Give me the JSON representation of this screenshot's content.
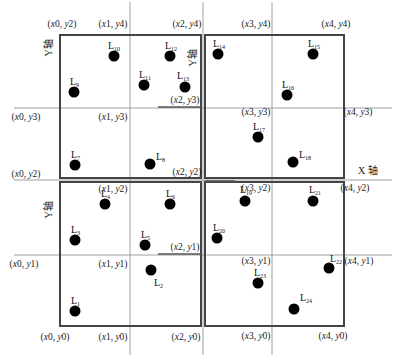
{
  "diagram": {
    "title": "",
    "axis_labels": {
      "x": "X 轴",
      "y_top": "Y轴",
      "y_mid": "Y轴",
      "y_bottom": "Y轴"
    },
    "colors": {
      "frame": "#444444",
      "grid": "#888888",
      "point": "#000000",
      "text": "#222222"
    },
    "quadrants": [
      {
        "name": "top-left",
        "x0": 60,
        "y0": 35,
        "x1": 201,
        "y1": 178
      },
      {
        "name": "top-right",
        "x0": 205,
        "y0": 35,
        "x1": 344,
        "y1": 178
      },
      {
        "name": "bottom-left",
        "x0": 60,
        "y0": 182,
        "x1": 201,
        "y1": 326
      },
      {
        "name": "bottom-right",
        "x0": 205,
        "y0": 182,
        "x1": 344,
        "y1": 326
      }
    ],
    "coordinate_labels": [
      {
        "id": "x0y2_top",
        "text": "(x0, y2)",
        "x": 62,
        "y": 27
      },
      {
        "id": "x1y4",
        "text": "(x1, y4)",
        "x": 113,
        "y": 27
      },
      {
        "id": "x2y4",
        "text": "(x2, y4)",
        "x": 187,
        "y": 27
      },
      {
        "id": "x3y4",
        "text": "(x3, y4)",
        "x": 256,
        "y": 27
      },
      {
        "id": "x4y4",
        "text": "(x4, y4)",
        "x": 336,
        "y": 27
      },
      {
        "id": "x0y3",
        "text": "(x0, y3)",
        "x": 26,
        "y": 120
      },
      {
        "id": "x1y3",
        "text": "(x1, y3)",
        "x": 113,
        "y": 120
      },
      {
        "id": "x2y3",
        "text": "(x2, y3)",
        "x": 185,
        "y": 103
      },
      {
        "id": "x3y3",
        "text": "(x3, y3)",
        "x": 256,
        "y": 115
      },
      {
        "id": "x4y3",
        "text": "(x4, y3)",
        "x": 358,
        "y": 115
      },
      {
        "id": "x0y2",
        "text": "(x0, y2)",
        "x": 26,
        "y": 177
      },
      {
        "id": "x2y2",
        "text": "(x2, y2)",
        "x": 187,
        "y": 175
      },
      {
        "id": "x4y2",
        "text": "(x4, y2)",
        "x": 355,
        "y": 191
      },
      {
        "id": "x1y2",
        "text": "(x1, y2)",
        "x": 113,
        "y": 192
      },
      {
        "id": "x3y2",
        "text": "(x3, y2)",
        "x": 256,
        "y": 191
      },
      {
        "id": "x2y1",
        "text": "(x2, y1)",
        "x": 185,
        "y": 250
      },
      {
        "id": "x0y1",
        "text": "(x0, y1)",
        "x": 24,
        "y": 267
      },
      {
        "id": "x1y1",
        "text": "(x1, y1)",
        "x": 113,
        "y": 267
      },
      {
        "id": "x3y1",
        "text": "(x3, y1)",
        "x": 256,
        "y": 264
      },
      {
        "id": "x4y1",
        "text": "(x4, y1)",
        "x": 359,
        "y": 264
      },
      {
        "id": "x0y0",
        "text": "(x0, y0)",
        "x": 55,
        "y": 340
      },
      {
        "id": "x1y0",
        "text": "(x1, y0)",
        "x": 113,
        "y": 340
      },
      {
        "id": "x2y0",
        "text": "(x2, y0)",
        "x": 186,
        "y": 340
      },
      {
        "id": "x3y0",
        "text": "(x3, y0)",
        "x": 256,
        "y": 339
      },
      {
        "id": "x4y0",
        "text": "(x4, y0)",
        "x": 333,
        "y": 339
      }
    ],
    "points": [
      {
        "label": "L",
        "sub": "1",
        "cx": 75,
        "cy": 311,
        "lx": 71,
        "ly": 304
      },
      {
        "label": "L",
        "sub": "2",
        "cx": 151,
        "cy": 270,
        "lx": 154,
        "ly": 286
      },
      {
        "label": "L",
        "sub": "3",
        "cx": 75,
        "cy": 240,
        "lx": 71,
        "ly": 233
      },
      {
        "label": "L",
        "sub": "4",
        "cx": 105,
        "cy": 204,
        "lx": 101,
        "ly": 197
      },
      {
        "label": "L",
        "sub": "5",
        "cx": 145,
        "cy": 245,
        "lx": 141,
        "ly": 238
      },
      {
        "label": "L",
        "sub": "6",
        "cx": 170,
        "cy": 204,
        "lx": 166,
        "ly": 197
      },
      {
        "label": "L",
        "sub": "7",
        "cx": 75,
        "cy": 165,
        "lx": 71,
        "ly": 158
      },
      {
        "label": "L",
        "sub": "8",
        "cx": 150,
        "cy": 164,
        "lx": 156,
        "ly": 160
      },
      {
        "label": "L",
        "sub": "9",
        "cx": 74,
        "cy": 92,
        "lx": 70,
        "ly": 85
      },
      {
        "label": "L",
        "sub": "10",
        "cx": 114,
        "cy": 56,
        "lx": 108,
        "ly": 49
      },
      {
        "label": "L",
        "sub": "11",
        "cx": 144,
        "cy": 85,
        "lx": 139,
        "ly": 78
      },
      {
        "label": "L",
        "sub": "12",
        "cx": 170,
        "cy": 56,
        "lx": 165,
        "ly": 49
      },
      {
        "label": "L",
        "sub": "13",
        "cx": 185,
        "cy": 87,
        "lx": 177,
        "ly": 79
      },
      {
        "label": "L",
        "sub": "14",
        "cx": 218,
        "cy": 54,
        "lx": 213,
        "ly": 47
      },
      {
        "label": "L",
        "sub": "15",
        "cx": 313,
        "cy": 54,
        "lx": 308,
        "ly": 47
      },
      {
        "label": "L",
        "sub": "16",
        "cx": 287,
        "cy": 95,
        "lx": 282,
        "ly": 88
      },
      {
        "label": "L",
        "sub": "17",
        "cx": 258,
        "cy": 137,
        "lx": 253,
        "ly": 130
      },
      {
        "label": "L",
        "sub": "18",
        "cx": 293,
        "cy": 162,
        "lx": 299,
        "ly": 158
      },
      {
        "label": "L",
        "sub": "19",
        "cx": 245,
        "cy": 201,
        "lx": 240,
        "ly": 193
      },
      {
        "label": "L",
        "sub": "20",
        "cx": 217,
        "cy": 238,
        "lx": 213,
        "ly": 231
      },
      {
        "label": "L",
        "sub": "21",
        "cx": 313,
        "cy": 201,
        "lx": 309,
        "ly": 193
      },
      {
        "label": "L",
        "sub": "22",
        "cx": 329,
        "cy": 268,
        "lx": 330,
        "ly": 262
      },
      {
        "label": "L",
        "sub": "23",
        "cx": 258,
        "cy": 283,
        "lx": 254,
        "ly": 276
      },
      {
        "label": "L",
        "sub": "24",
        "cx": 294,
        "cy": 309,
        "lx": 300,
        "ly": 301
      }
    ]
  }
}
